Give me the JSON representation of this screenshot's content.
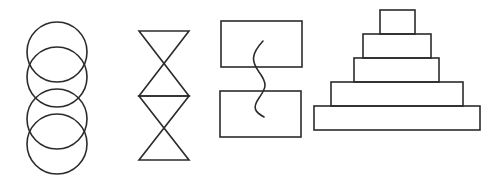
{
  "diagram": {
    "background": "#ffffff",
    "stroke_color": "#2b2b2b",
    "figures": [
      {
        "id": "stacked-circles",
        "type": "overlapping-circles",
        "count": 4,
        "circles": [
          {
            "cx": 57,
            "cy": 52,
            "r": 30
          },
          {
            "cx": 57,
            "cy": 77,
            "r": 30
          },
          {
            "cx": 57,
            "cy": 119,
            "r": 30
          },
          {
            "cx": 57,
            "cy": 144,
            "r": 30
          }
        ]
      },
      {
        "id": "stacked-hourglasses",
        "type": "hourglasses",
        "count": 2,
        "hourglasses": [
          {
            "x1": 139,
            "x2": 189,
            "top": 31,
            "bottom": 96
          },
          {
            "x1": 139,
            "x2": 189,
            "top": 96,
            "bottom": 160
          }
        ]
      },
      {
        "id": "rectangles-with-wave",
        "type": "two-rectangles-wavy-line",
        "rects": [
          {
            "x": 221,
            "y": 21,
            "w": 81,
            "h": 46
          },
          {
            "x": 220,
            "y": 91,
            "w": 81,
            "h": 46
          }
        ],
        "wave_path": "M 263 41 C 250 55, 252 62, 259 72 C 268 84, 266 88, 259 98 C 252 108, 255 112, 264 117"
      },
      {
        "id": "stepped-pyramid",
        "type": "stacked-rectangles",
        "tiers": [
          {
            "x": 380,
            "y": 10,
            "w": 35,
            "h": 24
          },
          {
            "x": 363,
            "y": 34,
            "w": 68,
            "h": 24
          },
          {
            "x": 354,
            "y": 58,
            "w": 85,
            "h": 24
          },
          {
            "x": 331,
            "y": 82,
            "w": 132,
            "h": 24
          },
          {
            "x": 314,
            "y": 106,
            "w": 166,
            "h": 24
          }
        ]
      }
    ]
  }
}
